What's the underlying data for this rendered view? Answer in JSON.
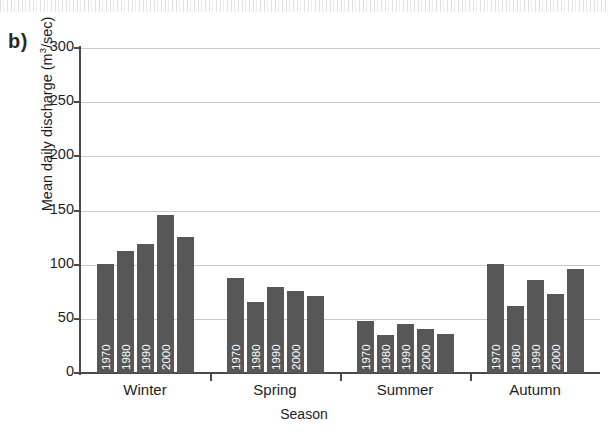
{
  "panel": {
    "label": "b)"
  },
  "axes": {
    "y_title_main": "Mean daily discharge (m",
    "y_title_sup": "3",
    "y_title_tail": "/sec)",
    "y_title_full": "Mean daily discharge (m3/sec)",
    "x_title": "Season",
    "y_ticks": [
      "0",
      "50",
      "100",
      "150",
      "200",
      "250",
      "300"
    ]
  },
  "colors": {
    "bar": "#575757",
    "gridline": "#c9c9c9",
    "axis": "#4a4a4a",
    "bar_label": "#ffffff"
  },
  "chart_data": {
    "type": "bar",
    "title": "",
    "xlabel": "Season",
    "ylabel": "Mean daily discharge (m3/sec)",
    "ylim": [
      0,
      300
    ],
    "ytick_step": 50,
    "grid": true,
    "legend": "none",
    "categories": [
      "Winter",
      "Spring",
      "Summer",
      "Autumn"
    ],
    "series": [
      {
        "name": "1960",
        "values": [
          101,
          88,
          48,
          101
        ]
      },
      {
        "name": "1970",
        "values": [
          113,
          66,
          35,
          62
        ]
      },
      {
        "name": "1980",
        "values": [
          119,
          79,
          45,
          86
        ]
      },
      {
        "name": "1990",
        "values": [
          146,
          76,
          41,
          73
        ]
      },
      {
        "name": "2000",
        "values": [
          126,
          71,
          36,
          96
        ]
      }
    ],
    "bar_inner_labels": [
      "1960",
      "1970",
      "1980",
      "1990",
      "2000"
    ]
  }
}
